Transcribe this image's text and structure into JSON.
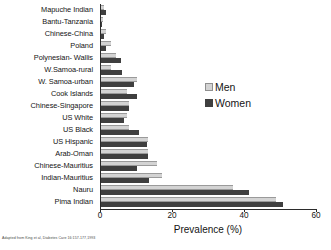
{
  "chart_data": {
    "type": "bar",
    "orientation": "horizontal",
    "title": "",
    "xlabel": "Prevalence (%)",
    "ylabel": "",
    "xlim": [
      0,
      60
    ],
    "xticks": [
      0,
      20,
      40,
      60
    ],
    "grid": false,
    "legend_position": "center-right",
    "categories": [
      "Mapuche Indian",
      "Bantu-Tanzania",
      "Chinese-China",
      "Poland",
      "Polynesian- Wallis",
      "W.Samoa-rural",
      "W. Samoa-urban",
      "Cook Islands",
      "Chinese-Singapore",
      "US White",
      "US Black",
      "US Hispanic",
      "Arab-Oman",
      "Chinese-Mauritius",
      "Indian-Mauritius",
      "Nauru",
      "Pima Indian"
    ],
    "series": [
      {
        "name": "Men",
        "color": "#d3d3d3",
        "values": [
          1.0,
          0.8,
          1.6,
          3.0,
          4.5,
          3.2,
          10.3,
          7.5,
          8.0,
          7.5,
          8.0,
          13.5,
          13.5,
          16.0,
          17.3,
          37.0,
          49.0
        ]
      },
      {
        "name": "Women",
        "color": "#3f3f3f",
        "values": [
          1.8,
          0.6,
          1.2,
          1.8,
          5.8,
          6.0,
          9.5,
          10.3,
          8.2,
          6.8,
          11.0,
          13.0,
          13.5,
          10.4,
          13.8,
          41.5,
          51.0
        ]
      }
    ]
  },
  "legend": {
    "men_label": "Men",
    "women_label": "Women"
  },
  "axis": {
    "x_title": "Prevalence (%)",
    "tick_0": "0",
    "tick_20": "20",
    "tick_40": "40",
    "tick_60": "60"
  },
  "caption": {
    "text": "Adapted from King et al, Diabetes Care 16:157-177,1993"
  }
}
